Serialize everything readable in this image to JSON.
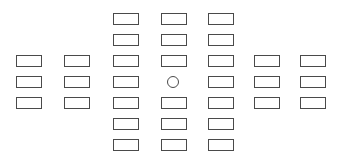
{
  "diagram": {
    "type": "grid-layout",
    "background": "#ffffff",
    "stroke_color": "#4a4a4a",
    "rect_size": {
      "width": 26,
      "height": 12
    },
    "columns_x": [
      16,
      64,
      113,
      161,
      208,
      254,
      300
    ],
    "rows_y": [
      13,
      34,
      55,
      76,
      97,
      118,
      139
    ],
    "rectangles": [
      {
        "col": 2,
        "row": 0
      },
      {
        "col": 3,
        "row": 0
      },
      {
        "col": 4,
        "row": 0
      },
      {
        "col": 2,
        "row": 1
      },
      {
        "col": 3,
        "row": 1
      },
      {
        "col": 4,
        "row": 1
      },
      {
        "col": 0,
        "row": 2
      },
      {
        "col": 1,
        "row": 2
      },
      {
        "col": 2,
        "row": 2
      },
      {
        "col": 3,
        "row": 2
      },
      {
        "col": 4,
        "row": 2
      },
      {
        "col": 5,
        "row": 2
      },
      {
        "col": 6,
        "row": 2
      },
      {
        "col": 0,
        "row": 3
      },
      {
        "col": 1,
        "row": 3
      },
      {
        "col": 2,
        "row": 3
      },
      {
        "col": 4,
        "row": 3
      },
      {
        "col": 5,
        "row": 3
      },
      {
        "col": 6,
        "row": 3
      },
      {
        "col": 0,
        "row": 4
      },
      {
        "col": 1,
        "row": 4
      },
      {
        "col": 2,
        "row": 4
      },
      {
        "col": 3,
        "row": 4
      },
      {
        "col": 4,
        "row": 4
      },
      {
        "col": 5,
        "row": 4
      },
      {
        "col": 6,
        "row": 4
      },
      {
        "col": 2,
        "row": 5
      },
      {
        "col": 3,
        "row": 5
      },
      {
        "col": 4,
        "row": 5
      },
      {
        "col": 2,
        "row": 6
      },
      {
        "col": 3,
        "row": 6
      },
      {
        "col": 4,
        "row": 6
      }
    ],
    "center_marker": {
      "shape": "circle",
      "cx": 173,
      "cy": 82,
      "r": 5
    }
  }
}
